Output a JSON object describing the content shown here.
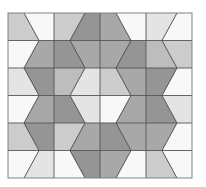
{
  "puzzle": {
    "type": "tessellation-tiling",
    "grid": {
      "rows": 6,
      "cols": 4
    },
    "board": {
      "x0": 8,
      "y0": 13,
      "col_width": 46,
      "row_height": 27.5
    },
    "zigzag": {
      "odd_rows": {
        "A": [
          24,
          39
        ],
        "B": [
          85,
          70
        ],
        "C": [
          116,
          131
        ],
        "D": [
          177,
          162
        ]
      },
      "even_rows": {
        "A": [
          39,
          24
        ],
        "B": [
          70,
          85
        ],
        "C": [
          131,
          116
        ],
        "D": [
          162,
          177
        ]
      }
    },
    "colors": {
      "white": "#f8f8f8",
      "very_light": "#e4e4e4",
      "light": "#cccccc",
      "medium_light": "#bdbdbd",
      "medium": "#a8a8a8",
      "dark": "#959595"
    },
    "rows": [
      [
        "light",
        "white",
        "light",
        "dark",
        "medium",
        "white",
        "very_light",
        "white"
      ],
      [
        "white",
        "medium",
        "dark",
        "medium",
        "medium",
        "dark",
        "medium_light",
        "light"
      ],
      [
        "very_light",
        "dark",
        "medium_light",
        "very_light",
        "light",
        "medium",
        "dark",
        "white"
      ],
      [
        "white",
        "medium",
        "dark",
        "very_light",
        "white",
        "medium",
        "dark",
        "very_light"
      ],
      [
        "light",
        "dark",
        "light",
        "medium",
        "dark",
        "medium",
        "medium",
        "white"
      ],
      [
        "white",
        "very_light",
        "white",
        "dark",
        "medium",
        "white",
        "light",
        "white"
      ]
    ]
  }
}
